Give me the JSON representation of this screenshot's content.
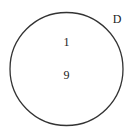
{
  "diagram": {
    "type": "venn",
    "set": {
      "label": "D",
      "stroke_color": "#333333",
      "fill_color": "#ffffff"
    },
    "elements": [
      "1",
      "9"
    ]
  }
}
